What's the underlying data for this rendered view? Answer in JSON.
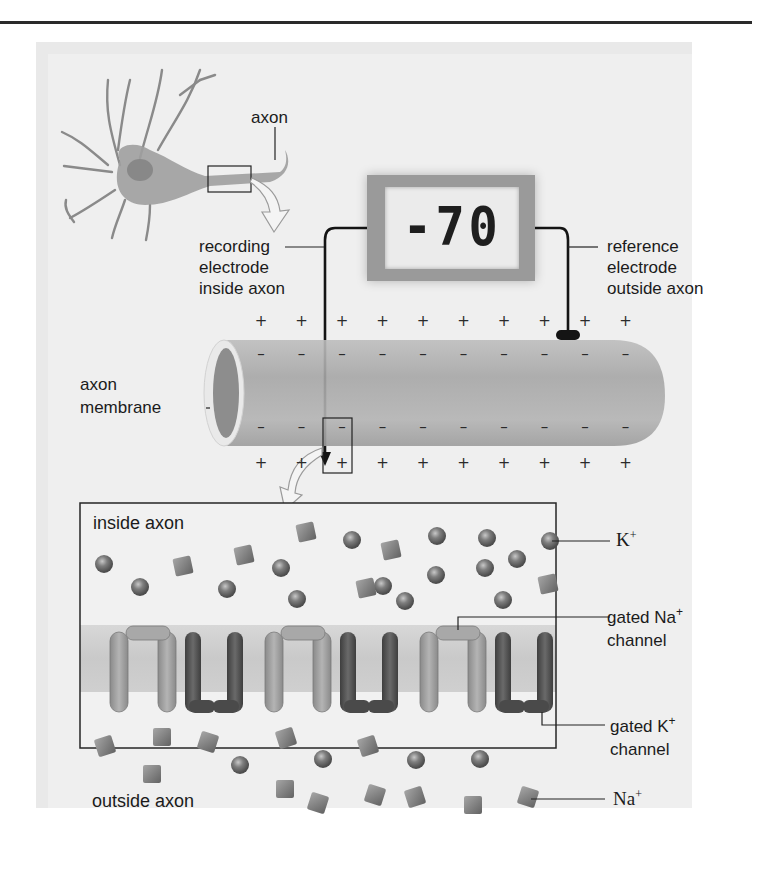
{
  "figure": {
    "neuron": {
      "axon_label": "axon"
    },
    "voltmeter": {
      "reading": "-70",
      "recording_electrode_label": [
        "recording",
        "electrode",
        "inside axon"
      ],
      "reference_electrode_label": [
        "reference",
        "electrode",
        "outside axon"
      ]
    },
    "axon_segment": {
      "membrane_label": [
        "axon",
        "membrane"
      ],
      "outside_charge": "+",
      "inside_charge": "–",
      "outside_top_count": 10,
      "outside_bottom_count": 10
    },
    "detail_panel": {
      "inside_label": "inside axon",
      "outside_label": "outside axon",
      "legend": {
        "k_ion": {
          "text": "K",
          "sup": "+"
        },
        "na_channel": {
          "line1_text": "gated Na",
          "line1_sup": "+",
          "line2": "channel"
        },
        "k_channel": {
          "line1_text": "gated K",
          "line1_sup": "+",
          "line2": "channel"
        },
        "na_ion": {
          "text": "Na",
          "sup": "+"
        }
      }
    },
    "colors": {
      "background": "#efefef",
      "axon_fill": "#a9a9a9",
      "na_channel": "#9c9c9c",
      "k_channel": "#555555",
      "ion": "#7d7d7d",
      "membrane_band": "#bdbdbd",
      "line": "#1a1a1a"
    }
  }
}
